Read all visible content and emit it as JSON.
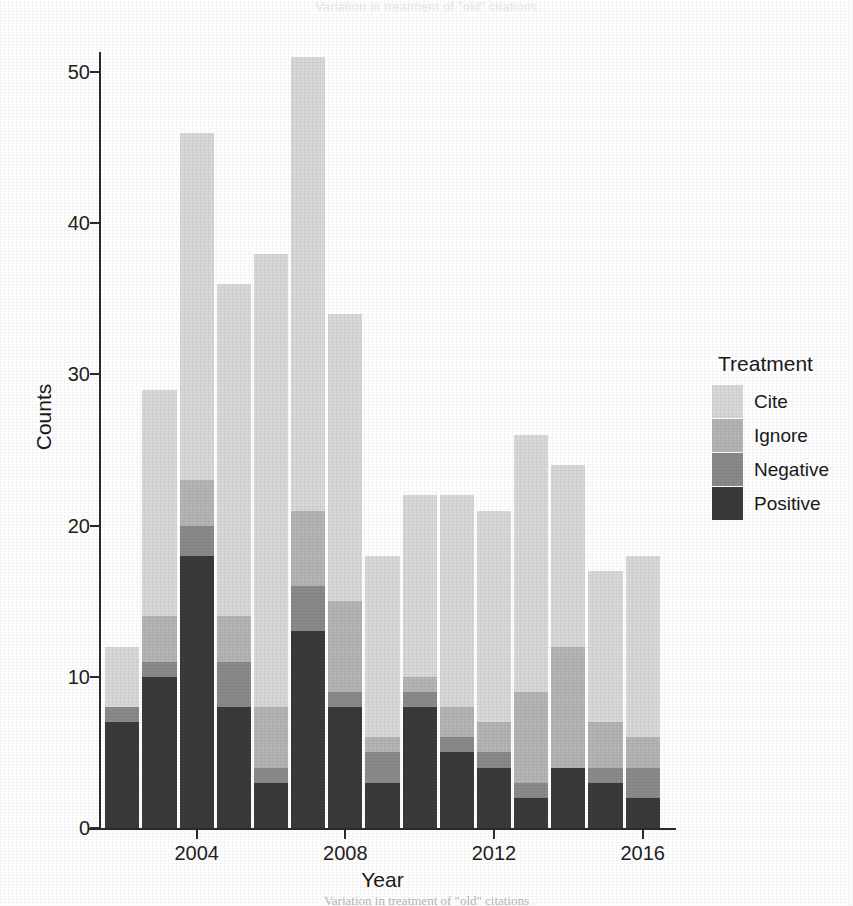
{
  "bleed_text": "Variation in treatment of \"old\" citations",
  "caption": "Variation in treatment of \"old\" citations",
  "legend": {
    "title": "Treatment",
    "entries": [
      {
        "label": "Cite",
        "color": "#d8d8d8"
      },
      {
        "label": "Ignore",
        "color": "#b4b4b4"
      },
      {
        "label": "Negative",
        "color": "#8a8a8a"
      },
      {
        "label": "Positive",
        "color": "#3a3a3a"
      }
    ]
  },
  "chart_data": {
    "type": "bar",
    "subtype": "stacked",
    "title": "",
    "xlabel": "Year",
    "ylabel": "Counts",
    "xlim": [
      2001.4,
      2016.6
    ],
    "ylim": [
      0,
      51
    ],
    "yticks": [
      0,
      10,
      20,
      30,
      40,
      50
    ],
    "ytick_labels": [
      "0",
      "10",
      "20",
      "30",
      "40",
      "50"
    ],
    "xticks": [
      2004,
      2008,
      2012,
      2016
    ],
    "xtick_labels": [
      "2004",
      "2008",
      "2012",
      "2016"
    ],
    "grid": false,
    "legend_position": "right",
    "legend_title": "Treatment",
    "categories": [
      2002,
      2003,
      2004,
      2005,
      2006,
      2007,
      2008,
      2009,
      2010,
      2011,
      2012,
      2013,
      2014,
      2015,
      2016
    ],
    "stack_order_bottom_to_top": [
      "Positive",
      "Negative",
      "Ignore",
      "Cite"
    ],
    "series": [
      {
        "name": "Positive",
        "color": "#3a3a3a",
        "values": [
          7,
          10,
          18,
          8,
          3,
          13,
          8,
          3,
          8,
          5,
          4,
          2,
          4,
          3,
          2
        ]
      },
      {
        "name": "Negative",
        "color": "#8a8a8a",
        "values": [
          1,
          1,
          2,
          3,
          1,
          3,
          1,
          2,
          1,
          1,
          1,
          1,
          0,
          1,
          2
        ]
      },
      {
        "name": "Ignore",
        "color": "#b4b4b4",
        "values": [
          0,
          3,
          3,
          3,
          4,
          5,
          6,
          1,
          1,
          2,
          2,
          6,
          8,
          3,
          2
        ]
      },
      {
        "name": "Cite",
        "color": "#d8d8d8",
        "values": [
          4,
          15,
          23,
          22,
          30,
          30,
          19,
          12,
          12,
          14,
          14,
          17,
          12,
          10,
          12
        ]
      }
    ],
    "totals": [
      12,
      29,
      46,
      36,
      38,
      51,
      34,
      18,
      22,
      22,
      21,
      26,
      24,
      17,
      18
    ]
  }
}
